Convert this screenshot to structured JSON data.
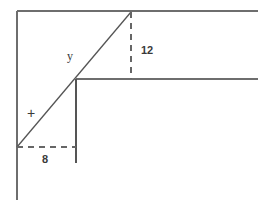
{
  "diagram": {
    "background_color": "#ffffff",
    "stroke_color": "#6e6e6e",
    "diagonal_color": "#555555",
    "label_color": "#3a3a3a",
    "width": 268,
    "height": 212,
    "labels": {
      "vertical_leg": "12",
      "horizontal_leg": "8",
      "upper_hypotenuse": "y",
      "lower_hypotenuse": "+"
    },
    "geometry": {
      "left_vertical": {
        "x": 17,
        "y1": 11,
        "y2": 200,
        "style": "solid"
      },
      "top_horizontal": {
        "y": 11,
        "x1": 17,
        "x2": 258,
        "style": "solid"
      },
      "middle_horizontal": {
        "y": 79,
        "x1": 76,
        "x2": 258,
        "style": "solid"
      },
      "inner_vertical": {
        "x": 76,
        "y1": 79,
        "y2": 163,
        "style": "solid"
      },
      "diagonal": {
        "x1": 17,
        "y1": 147,
        "x2": 131,
        "y2": 12,
        "style": "solid"
      },
      "dashed_vertical": {
        "x": 131,
        "y1": 12,
        "y2": 79,
        "style": "dashed"
      },
      "dashed_horizontal": {
        "y": 147,
        "x1": 17,
        "x2": 76,
        "style": "dashed"
      }
    },
    "label_positions": {
      "vertical_leg": {
        "x": 141,
        "y": 51
      },
      "horizontal_leg": {
        "x": 42,
        "y": 160
      },
      "upper_hypotenuse": {
        "x": 70,
        "y": 57
      },
      "lower_hypotenuse": {
        "x": 31,
        "y": 114
      }
    }
  }
}
